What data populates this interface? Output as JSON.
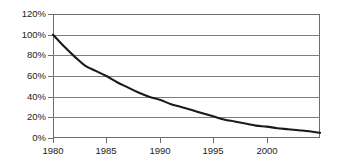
{
  "chart_data": {
    "type": "line",
    "title": "",
    "subtitle": "",
    "xlabel": "",
    "ylabel": "",
    "grid": true,
    "legend": null,
    "xlim": [
      1980,
      2005
    ],
    "ylim": [
      0,
      120
    ],
    "y_tick_labels": [
      "120%",
      "100%",
      "80%",
      "60%",
      "40%",
      "20%",
      "0%"
    ],
    "y_tick_values": [
      120,
      100,
      80,
      60,
      40,
      20,
      0
    ],
    "x_tick_labels": [
      "1980",
      "1985",
      "1990",
      "1995",
      "2000"
    ],
    "x_tick_values": [
      1980,
      1985,
      1990,
      1995,
      2000
    ],
    "series": [
      {
        "name": "decay",
        "x": [
          1980,
          1981,
          1982,
          1983,
          1984,
          1985,
          1986,
          1987,
          1988,
          1989,
          1990,
          1991,
          1992,
          1993,
          1994,
          1995,
          1996,
          1997,
          1998,
          1999,
          2000,
          2001,
          2002,
          2003,
          2004,
          2005
        ],
        "values": [
          100,
          89,
          79,
          70,
          65,
          60,
          54,
          49,
          44,
          40,
          37,
          33,
          30,
          27,
          24,
          21,
          18,
          16,
          14,
          12,
          11,
          9.5,
          8.5,
          7.5,
          6.5,
          5
        ]
      }
    ],
    "colors": {
      "curve": "#1a1a1a",
      "grid": "#7d7d7d",
      "frame": "#6d6d6d",
      "background": "#ffffff",
      "text": "#1c1c1c"
    }
  }
}
